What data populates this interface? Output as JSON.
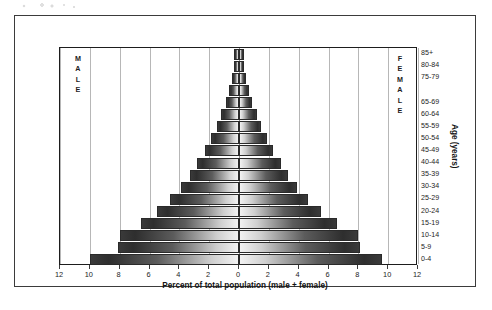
{
  "figure": {
    "left_panel_label": "MALE",
    "right_panel_label": "FEMALE"
  },
  "chart_data": {
    "type": "bar",
    "title": "",
    "subtitle": "",
    "orientation": "horizontal-diverging",
    "xlabel": "Percent of total population (male + female)",
    "ylabel": "Age (years)",
    "xlim": [
      -12,
      12
    ],
    "xticks": [
      12,
      10,
      8,
      6,
      4,
      2,
      0,
      2,
      4,
      6,
      8,
      10,
      12
    ],
    "xtick_labels": [
      "12",
      "10",
      "8",
      "6",
      "4",
      "2",
      "0",
      "2",
      "4",
      "6",
      "8",
      "10",
      "12"
    ],
    "grid": true,
    "grid_axis": "x",
    "legend": "none",
    "annotations": [
      "MALE",
      "FEMALE"
    ],
    "categories": [
      "85+",
      "80-84",
      "75-79",
      "70-74",
      "65-69",
      "60-64",
      "55-59",
      "50-54",
      "45-49",
      "40-44",
      "35-39",
      "30-34",
      "25-29",
      "20-24",
      "15-19",
      "10-14",
      "5-9",
      "0-4"
    ],
    "visible_tick_labels": [
      "85+",
      "80-84",
      "75-79",
      "65-69",
      "60-64",
      "55-59",
      "50-54",
      "45-49",
      "40-44",
      "35-39",
      "30-34",
      "25-29",
      "20-24",
      "15-19",
      "10-14",
      "5-9",
      "0-4"
    ],
    "series": [
      {
        "name": "MALE",
        "side": "left",
        "values": [
          0.35,
          0.35,
          0.5,
          0.7,
          0.9,
          1.2,
          1.5,
          1.9,
          2.3,
          2.8,
          3.3,
          3.9,
          4.6,
          5.5,
          6.6,
          8.0,
          8.1,
          10.0
        ]
      },
      {
        "name": "FEMALE",
        "side": "right",
        "values": [
          0.35,
          0.35,
          0.5,
          0.7,
          0.9,
          1.2,
          1.5,
          1.9,
          2.3,
          2.8,
          3.3,
          3.9,
          4.6,
          5.5,
          6.6,
          8.0,
          8.1,
          9.6
        ]
      }
    ]
  },
  "colors": {
    "bar_dark": "#2e2e2e",
    "bar_light": "#f2f2f2",
    "grid": "#b7b7b7",
    "axis": "#1d1d1d",
    "frame": "#3b3b3b"
  }
}
